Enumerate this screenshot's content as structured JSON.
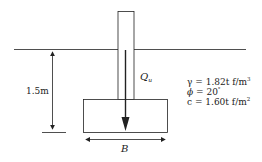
{
  "diagram": {
    "labels": {
      "depth": "1.5m",
      "load_symbol": "Q",
      "load_subscript": "u",
      "width_symbol": "B"
    },
    "soil_properties": [
      {
        "symbol": "γ",
        "text": " = 1.82t f/m",
        "sup": "3"
      },
      {
        "symbol": "ϕ",
        "text": " = 20",
        "sup": "°"
      },
      {
        "symbol": "c",
        "text": " = 1.60t f/m",
        "sup": "2"
      }
    ],
    "colors": {
      "line": "#222222",
      "background": "#ffffff"
    }
  }
}
